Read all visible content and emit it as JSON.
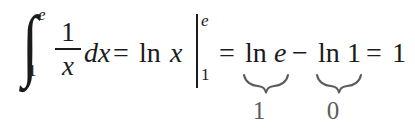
{
  "document": {
    "type": "math-equation",
    "background_color": "#ffffff",
    "text_color": "#1b1b1b",
    "annotation_color": "#5c5c5c",
    "plain_text": "∫_1^e (1/x) dx = ln x |_1^e = ln e − ln 1 = 1"
  },
  "integral": {
    "sign": "∫",
    "upper_limit": "e",
    "lower_limit": "1",
    "integrand": {
      "numerator": "1",
      "denominator": "x"
    },
    "differential": "dx"
  },
  "equals_1": "=",
  "antiderivative": {
    "operator": "ln",
    "argument": "x"
  },
  "evaluation_bar": {
    "glyph": "|",
    "upper_limit": "e",
    "lower_limit": "1"
  },
  "equals_2": "=",
  "expansion": {
    "first_term": {
      "operator": "ln",
      "argument": "e",
      "underbrace_label": "1"
    },
    "operator": "−",
    "second_term": {
      "operator": "ln",
      "argument": "1",
      "underbrace_label": "0"
    }
  },
  "equals_3": "=",
  "result": "1"
}
